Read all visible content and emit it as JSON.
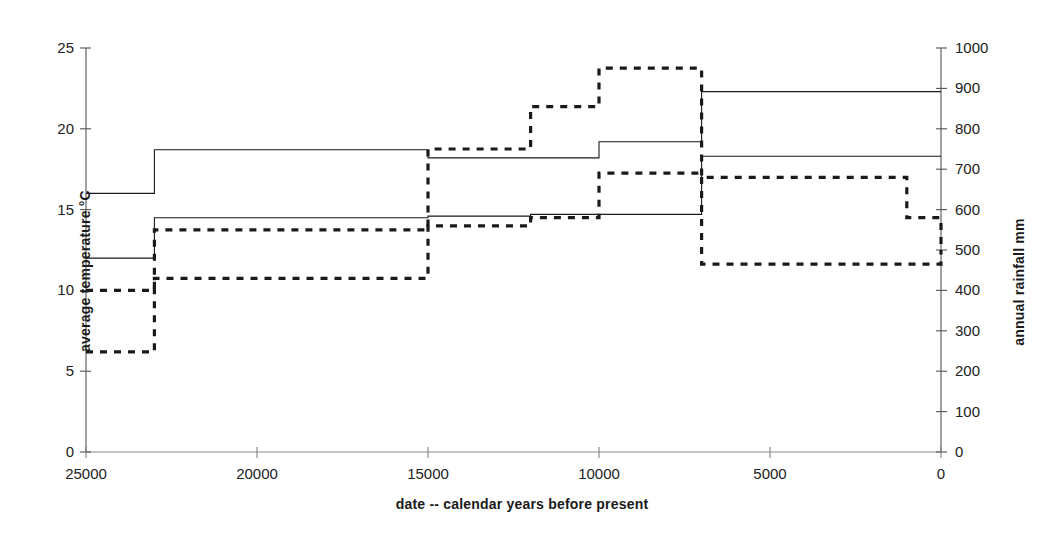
{
  "chart_data": {
    "type": "line",
    "title": "",
    "xlabel": "date --  calendar years before present",
    "ylabel": "average temperature  °C",
    "ylabel_right": "annual rainfall  mm",
    "xlim": [
      25000,
      0
    ],
    "x_reversed": true,
    "ylim": [
      0,
      25
    ],
    "ylim_right": [
      0,
      1000
    ],
    "grid": false,
    "legend": "none",
    "xticks": [
      25000,
      20000,
      15000,
      10000,
      5000,
      0
    ],
    "xticklabels": [
      "25000",
      "20000",
      "15000",
      "10000",
      "5000",
      "0"
    ],
    "yticks": [
      0,
      5,
      10,
      15,
      20,
      25
    ],
    "yticklabels": [
      "0",
      "5",
      "10",
      "15",
      "20",
      "25"
    ],
    "yticks_right": [
      0,
      100,
      200,
      300,
      400,
      500,
      600,
      700,
      800,
      900,
      1000
    ],
    "yticklabels_right": [
      "0",
      "100",
      "200",
      "300",
      "400",
      "500",
      "600",
      "700",
      "800",
      "900",
      "1000"
    ],
    "step_breaks": [
      25000,
      23000,
      15000,
      12000,
      10000,
      7000,
      0
    ],
    "series": [
      {
        "name": "maximum average temperature",
        "axis": "left",
        "style": "solid",
        "units": "°C",
        "step": true,
        "x": [
          25000,
          23000,
          15000,
          12000,
          10000,
          7000,
          0
        ],
        "values": [
          16.0,
          18.7,
          18.2,
          18.2,
          19.2,
          22.3,
          22.3
        ]
      },
      {
        "name": "minimum average temperature",
        "axis": "left",
        "style": "solid",
        "units": "°C",
        "step": true,
        "x": [
          25000,
          23000,
          15000,
          12000,
          10000,
          7000,
          0
        ],
        "values": [
          12.0,
          14.5,
          14.6,
          14.7,
          14.7,
          18.3,
          18.3
        ]
      },
      {
        "name": "maximum annual rainfall",
        "axis": "right",
        "style": "dashed",
        "units": "mm",
        "step": true,
        "x": [
          25000,
          23000,
          15000,
          12000,
          10000,
          7000,
          1000,
          0
        ],
        "values": [
          400,
          550,
          750,
          855,
          950,
          680,
          580,
          500
        ]
      },
      {
        "name": "minimum annual rainfall",
        "axis": "right",
        "style": "dashed",
        "units": "mm",
        "step": true,
        "x": [
          25000,
          23000,
          15000,
          12000,
          10000,
          7000,
          1000,
          0
        ],
        "values": [
          248,
          430,
          560,
          580,
          690,
          465,
          465,
          500
        ]
      }
    ]
  }
}
